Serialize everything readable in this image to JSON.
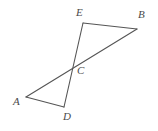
{
  "figure": {
    "background_color": "#ffffff",
    "stroke_color": "#555555",
    "label_color": "#4a4a4a",
    "stroke_width": 1.1,
    "width": 158,
    "height": 131
  },
  "chart_data": {
    "type": "diagram",
    "subtype": "geometry-line-figure",
    "title": "",
    "points": [
      {
        "id": "A",
        "label": "A",
        "x": 26,
        "y": 97,
        "label_x": 13,
        "label_y": 96
      },
      {
        "id": "B",
        "label": "B",
        "x": 137,
        "y": 29,
        "label_x": 138,
        "label_y": 9
      },
      {
        "id": "C",
        "label": "C",
        "x": 70,
        "y": 63,
        "label_x": 77,
        "label_y": 65
      },
      {
        "id": "D",
        "label": "D",
        "x": 64,
        "y": 107,
        "label_x": 63,
        "label_y": 111
      },
      {
        "id": "E",
        "label": "E",
        "x": 83,
        "y": 23,
        "label_x": 76,
        "label_y": 7
      }
    ],
    "segments": [
      {
        "id": "EB",
        "from": "E",
        "to": "B",
        "x1": 83,
        "y1": 23,
        "x2": 137,
        "y2": 29
      },
      {
        "id": "BA",
        "from": "B",
        "to": "A",
        "x1": 137,
        "y1": 29,
        "x2": 26,
        "y2": 97
      },
      {
        "id": "ED",
        "from": "E",
        "to": "D",
        "x1": 83,
        "y1": 23,
        "x2": 64,
        "y2": 107
      },
      {
        "id": "AD",
        "from": "A",
        "to": "D",
        "x1": 26,
        "y1": 97,
        "x2": 64,
        "y2": 107
      }
    ],
    "intersection": {
      "id": "C",
      "of": [
        "BA",
        "ED"
      ],
      "x": 70,
      "y": 63
    },
    "triangles": [
      {
        "id": "EBC",
        "vertices": [
          "E",
          "B",
          "C"
        ]
      },
      {
        "id": "ACD",
        "vertices": [
          "A",
          "C",
          "D"
        ]
      }
    ]
  }
}
